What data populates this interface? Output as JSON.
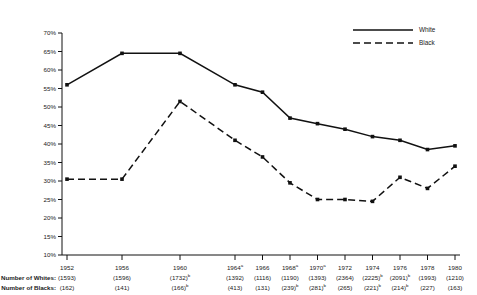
{
  "chart_data": {
    "type": "line",
    "title": "",
    "xlabel": "",
    "ylabel": "",
    "ylim": [
      10,
      70
    ],
    "ytick_step": 5,
    "grid": false,
    "legend_position": "top-right",
    "categories": [
      "1952",
      "1956",
      "1960",
      "1964",
      "1966",
      "1968",
      "1970",
      "1972",
      "1974",
      "1976",
      "1978",
      "1980"
    ],
    "x_tick_labels": [
      "1952",
      "1956",
      "1960",
      "1964",
      "1966",
      "1968",
      "1970",
      "1972",
      "1974",
      "1976",
      "1978",
      "1980"
    ],
    "x_tick_superscripts": [
      "",
      "",
      "",
      "a",
      "",
      "a",
      "a",
      "",
      "",
      "",
      "",
      ""
    ],
    "y_tick_labels": [
      "70%",
      "65%",
      "60%",
      "55%",
      "50%",
      "45%",
      "40%",
      "35%",
      "30%",
      "25%",
      "20%",
      "15%",
      "10%"
    ],
    "y_tick_values": [
      70,
      65,
      60,
      55,
      50,
      45,
      40,
      35,
      30,
      25,
      20,
      15,
      10
    ],
    "series": [
      {
        "name": "White",
        "style": "solid",
        "color": "#111111",
        "values": [
          56.0,
          64.5,
          64.5,
          56.0,
          54.0,
          47.0,
          45.5,
          44.0,
          42.0,
          41.0,
          38.5,
          39.5
        ]
      },
      {
        "name": "Black",
        "style": "dashed",
        "color": "#111111",
        "values": [
          30.5,
          30.5,
          51.5,
          41.0,
          36.5,
          29.5,
          25.0,
          25.0,
          24.5,
          31.0,
          28.0,
          34.0
        ]
      }
    ]
  },
  "legend": {
    "entries": [
      {
        "label": "White",
        "style": "solid"
      },
      {
        "label": "Black",
        "style": "dashed"
      }
    ]
  },
  "footer_table": {
    "rows": [
      {
        "label": "Number of Whites:",
        "values": [
          "(1593)",
          "(1596)",
          "(1732)",
          "(1392)",
          "(1116)",
          "(1190)",
          "(1393)",
          "(2364)",
          "(2225)",
          "(2091)",
          "(1993)",
          "(1210)"
        ],
        "superscripts": [
          "",
          "",
          "b",
          "",
          "",
          "",
          "",
          "",
          "b",
          "b",
          "",
          ""
        ]
      },
      {
        "label": "Number of Blacks:",
        "values": [
          "(162)",
          "(141)",
          "(166)",
          "(413)",
          "(131)",
          "(239)",
          "(281)",
          "(265)",
          "(221)",
          "(214)",
          "(227)",
          "(163)"
        ],
        "superscripts": [
          "",
          "",
          "b",
          "",
          "",
          "b",
          "b",
          "",
          "b",
          "b",
          "",
          ""
        ]
      }
    ]
  }
}
